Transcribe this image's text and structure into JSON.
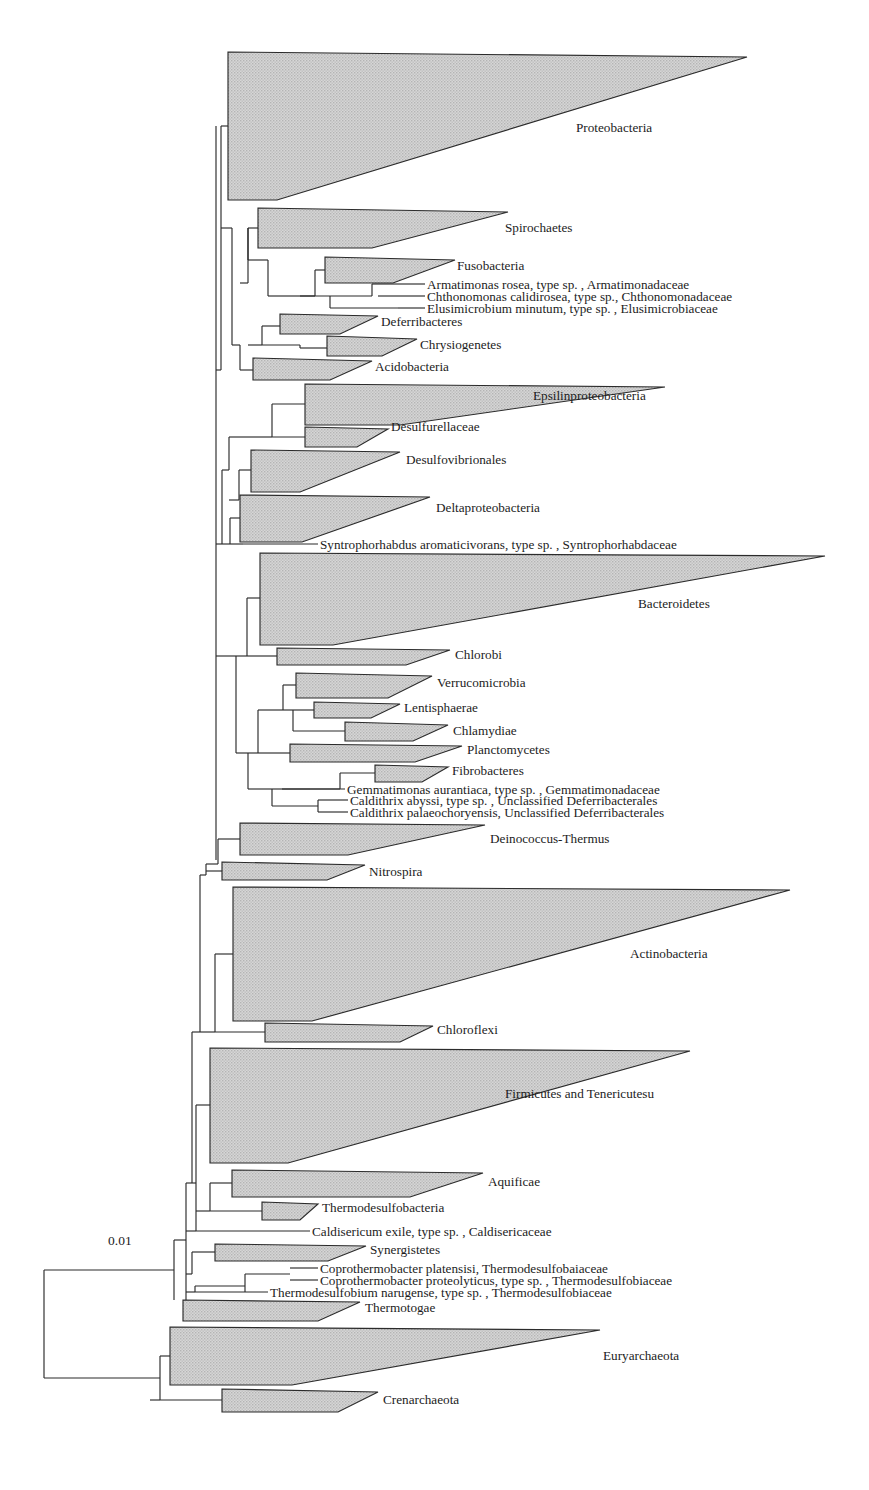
{
  "figure": {
    "type": "phylogenetic-tree",
    "orientation": "left-to-right",
    "background_color": "#ffffff",
    "clade_fill_color": "#c8c8c8",
    "line_color": "#2b2b2b",
    "text_color": "#1c1c1c"
  },
  "scale": {
    "label": "0.01",
    "x": 108,
    "y": 1245,
    "bar_visible": false
  },
  "chart_data": {
    "type": "tree",
    "title": "",
    "scale_bar": "0.01",
    "leaf_count": 38,
    "collapsed_clades": [
      "Proteobacteria",
      "Spirochaetes",
      "Fusobacteria",
      "Deferribacteres",
      "Chrysiogenetes",
      "Acidobacteria",
      "Epsilinproteobacteria",
      "Desulfurellaceae",
      "Desulfovibrionales",
      "Deltaproteobacteria",
      "Bacteroidetes",
      "Chlorobi",
      "Verrucomicrobia",
      "Lentisphaerae",
      "Chlamydiae",
      "Planctomycetes",
      "Fibrobacteres",
      "Deinococcus-Thermus",
      "Nitrospira",
      "Actinobacteria",
      "Chloroflexi",
      "Firmicutes and Tenericutesu",
      "Aquificae",
      "Thermodesulfobacteria",
      "Synergistetes",
      "Thermotogae",
      "Euryarchaeota",
      "Crenarchaeota"
    ],
    "terminal_taxa": [
      "Armatimonas rosea, type sp. , Armatimonadaceae",
      "Chthonomonas calidirosea, type sp., Chthonomonadaceae",
      "Elusimicrobium minutum, type sp. , Elusimicrobiaceae",
      "Syntrophorhabdus aromaticivorans, type sp. , Syntrophorhabdaceae",
      "Gemmatimonas aurantiaca, type sp. , Gemmatimonadaceae",
      "Caldithrix abyssi, type sp. , Unclassified Deferribacterales",
      "Caldithrix palaeochoryensis, Unclassified Deferribacterales",
      "Caldisericum exile, type sp. , Caldisericaceae",
      "Coprothermobacter platensisi, Thermodesulfobaiaceae",
      "Coprothermobacter proteolyticus, type sp. , Thermodesulfobiaceae",
      "Thermodesulfobium narugense, type sp. , Thermodesulfobiaceae"
    ]
  },
  "clades": [
    {
      "name": "proteobacteria",
      "label": "Proteobacteria",
      "style": "italic",
      "base_x": 228,
      "top_y": 52,
      "bottom_y": 200,
      "tip_x": 747,
      "tip_y": 57,
      "notch_x": 277,
      "label_x": 576,
      "label_y": 132
    },
    {
      "name": "spirochaetes",
      "label": "Spirochaetes",
      "style": "italic",
      "base_x": 258,
      "top_y": 208,
      "bottom_y": 248,
      "tip_x": 508,
      "tip_y": 212,
      "notch_x": 372,
      "label_x": 505,
      "label_y": 232
    },
    {
      "name": "fusobacteria",
      "label": "Fusobacteria",
      "style": "italic",
      "base_x": 325,
      "top_y": 257,
      "bottom_y": 283,
      "tip_x": 455,
      "tip_y": 260,
      "notch_x": 393,
      "label_x": 457,
      "label_y": 270
    },
    {
      "name": "deferribacteres",
      "label": "Deferribacteres",
      "style": "italic",
      "base_x": 280,
      "top_y": 314,
      "bottom_y": 334,
      "tip_x": 378,
      "tip_y": 316,
      "notch_x": 340,
      "label_x": 381,
      "label_y": 326
    },
    {
      "name": "chrysiogenetes",
      "label": "Chrysiogenetes",
      "style": "italic",
      "base_x": 327,
      "top_y": 336,
      "bottom_y": 356,
      "tip_x": 417,
      "tip_y": 339,
      "notch_x": 382,
      "label_x": 420,
      "label_y": 349
    },
    {
      "name": "acidobacteria",
      "label": "Acidobacteria",
      "style": "italic",
      "base_x": 253,
      "top_y": 358,
      "bottom_y": 380,
      "tip_x": 372,
      "tip_y": 361,
      "notch_x": 330,
      "label_x": 375,
      "label_y": 371
    },
    {
      "name": "epsilinproteobacteria",
      "label": "Epsilinproteobacteria",
      "style": "italic",
      "base_x": 305,
      "top_y": 384,
      "bottom_y": 425,
      "tip_x": 665,
      "tip_y": 387,
      "notch_x": 400,
      "label_x": 533,
      "label_y": 400
    },
    {
      "name": "desulfurellaceae",
      "label": "Desulfurellaceae",
      "style": "italic",
      "base_x": 305,
      "top_y": 427,
      "bottom_y": 447,
      "tip_x": 388,
      "tip_y": 429,
      "notch_x": 357,
      "label_x": 391,
      "label_y": 431
    },
    {
      "name": "desulfovibrionales",
      "label": "Desulfovibrionales",
      "style": "italic",
      "base_x": 251,
      "top_y": 450,
      "bottom_y": 492,
      "tip_x": 400,
      "tip_y": 452,
      "notch_x": 300,
      "label_x": 406,
      "label_y": 464
    },
    {
      "name": "deltaproteobacteria",
      "label": "Deltaproteobacteria",
      "style": "italic",
      "base_x": 240,
      "top_y": 495,
      "bottom_y": 542,
      "tip_x": 430,
      "tip_y": 497,
      "notch_x": 302,
      "label_x": 436,
      "label_y": 512
    },
    {
      "name": "bacteroidetes",
      "label": "Bacteroidetes",
      "style": "italic",
      "base_x": 260,
      "top_y": 553,
      "bottom_y": 645,
      "tip_x": 825,
      "tip_y": 556,
      "notch_x": 333,
      "label_x": 638,
      "label_y": 608
    },
    {
      "name": "chlorobi",
      "label": "Chlorobi",
      "style": "italic",
      "base_x": 277,
      "top_y": 648,
      "bottom_y": 665,
      "tip_x": 450,
      "tip_y": 650,
      "notch_x": 406,
      "label_x": 455,
      "label_y": 659
    },
    {
      "name": "verrucomicrobia",
      "label": "Verrucomicrobia",
      "style": "italic",
      "base_x": 296,
      "top_y": 673,
      "bottom_y": 698,
      "tip_x": 432,
      "tip_y": 676,
      "notch_x": 388,
      "label_x": 437,
      "label_y": 687
    },
    {
      "name": "lentisphaerae",
      "label": "Lentisphaerae",
      "style": "italic",
      "base_x": 314,
      "top_y": 702,
      "bottom_y": 718,
      "tip_x": 400,
      "tip_y": 704,
      "notch_x": 371,
      "label_x": 404,
      "label_y": 712
    },
    {
      "name": "chlamydiae",
      "label": "Chlamydiae",
      "style": "italic",
      "base_x": 345,
      "top_y": 722,
      "bottom_y": 741,
      "tip_x": 448,
      "tip_y": 725,
      "notch_x": 413,
      "label_x": 453,
      "label_y": 735
    },
    {
      "name": "planctomycetes",
      "label": "Planctomycetes",
      "style": "italic",
      "base_x": 290,
      "top_y": 744,
      "bottom_y": 762,
      "tip_x": 462,
      "tip_y": 746,
      "notch_x": 415,
      "label_x": 467,
      "label_y": 754
    },
    {
      "name": "fibrobacteres",
      "label": "Fibrobacteres",
      "style": "italic",
      "base_x": 375,
      "top_y": 765,
      "bottom_y": 782,
      "tip_x": 448,
      "tip_y": 767,
      "notch_x": 422,
      "label_x": 452,
      "label_y": 775
    },
    {
      "name": "deinococcus-thermus",
      "label": "Deinococcus-Thermus",
      "style": "italic",
      "base_x": 240,
      "top_y": 823,
      "bottom_y": 855,
      "tip_x": 485,
      "tip_y": 825,
      "notch_x": 348,
      "label_x": 490,
      "label_y": 843
    },
    {
      "name": "nitrospira",
      "label": "Nitrospira",
      "style": "italic",
      "base_x": 222,
      "top_y": 862,
      "bottom_y": 880,
      "tip_x": 365,
      "tip_y": 865,
      "notch_x": 327,
      "label_x": 369,
      "label_y": 876
    },
    {
      "name": "actinobacteria",
      "label": "Actinobacteria",
      "style": "italic",
      "base_x": 233,
      "top_y": 887,
      "bottom_y": 1021,
      "tip_x": 790,
      "tip_y": 890,
      "notch_x": 312,
      "label_x": 630,
      "label_y": 958
    },
    {
      "name": "chloroflexi",
      "label": "Chloroflexi",
      "style": "italic",
      "base_x": 265,
      "top_y": 1023,
      "bottom_y": 1042,
      "tip_x": 433,
      "tip_y": 1026,
      "notch_x": 400,
      "label_x": 437,
      "label_y": 1034
    },
    {
      "name": "firmicutes-tenericutesu",
      "label": "Firmicutes and Tenericutesu",
      "style": "mixed",
      "label_parts": [
        {
          "text": "Firmicutes",
          "style": "italic"
        },
        {
          "text": " and ",
          "style": "roman"
        },
        {
          "text": "Tenericutesu",
          "style": "italic"
        }
      ],
      "base_x": 210,
      "top_y": 1048,
      "bottom_y": 1163,
      "tip_x": 690,
      "tip_y": 1051,
      "notch_x": 288,
      "label_x": 505,
      "label_y": 1098
    },
    {
      "name": "aquificae",
      "label": "Aquificae",
      "style": "italic",
      "base_x": 232,
      "top_y": 1170,
      "bottom_y": 1197,
      "tip_x": 483,
      "tip_y": 1173,
      "notch_x": 410,
      "label_x": 488,
      "label_y": 1186
    },
    {
      "name": "thermodesulfobacteria",
      "label": "Thermodesulfobacteria",
      "style": "italic",
      "base_x": 262,
      "top_y": 1202,
      "bottom_y": 1220,
      "tip_x": 318,
      "tip_y": 1204,
      "notch_x": 300,
      "label_x": 322,
      "label_y": 1212
    },
    {
      "name": "synergistetes",
      "label": "Synergistetes",
      "style": "italic",
      "base_x": 215,
      "top_y": 1244,
      "bottom_y": 1261,
      "tip_x": 366,
      "tip_y": 1246,
      "notch_x": 328,
      "label_x": 370,
      "label_y": 1254
    },
    {
      "name": "thermotogae",
      "label": "Thermotogae",
      "style": "italic",
      "base_x": 183,
      "top_y": 1300,
      "bottom_y": 1321,
      "tip_x": 360,
      "tip_y": 1302,
      "notch_x": 318,
      "label_x": 365,
      "label_y": 1312
    },
    {
      "name": "euryarchaeota",
      "label": "Euryarchaeota",
      "style": "italic",
      "base_x": 170,
      "top_y": 1327,
      "bottom_y": 1385,
      "tip_x": 600,
      "tip_y": 1330,
      "notch_x": 292,
      "label_x": 603,
      "label_y": 1360
    },
    {
      "name": "crenarchaeota",
      "label": "Crenarchaeota",
      "style": "italic",
      "base_x": 222,
      "top_y": 1389,
      "bottom_y": 1412,
      "tip_x": 378,
      "tip_y": 1392,
      "notch_x": 338,
      "label_x": 383,
      "label_y": 1404
    }
  ],
  "terminals": [
    {
      "name": "armatimonas-rosea",
      "y": 284,
      "line_x1": 398,
      "line_x2": 425,
      "label_x": 427,
      "parts": [
        {
          "text": "Armatimonas rosea",
          "style": "italic"
        },
        {
          "text": ", type sp. , ",
          "style": "roman"
        },
        {
          "text": "Armatimonadaceae",
          "style": "italic"
        }
      ]
    },
    {
      "name": "chthonomonas-calidirosea",
      "y": 296,
      "line_x1": 398,
      "line_x2": 425,
      "label_x": 427,
      "parts": [
        {
          "text": "Chthonomonas calidirosea",
          "style": "italic"
        },
        {
          "text": ", type sp., ",
          "style": "roman"
        },
        {
          "text": "Chthonomonadaceae",
          "style": "italic"
        }
      ]
    },
    {
      "name": "elusimicrobium-minutum",
      "y": 308,
      "line_x1": 398,
      "line_x2": 425,
      "label_x": 427,
      "parts": [
        {
          "text": "Elusimicrobium minutum",
          "style": "italic"
        },
        {
          "text": ", type sp. , ",
          "style": "roman"
        },
        {
          "text": "Elusimicrobiaceae",
          "style": "italic"
        }
      ]
    },
    {
      "name": "syntrophorhabdus-aromaticivorans",
      "y": 544,
      "line_x1": 243,
      "line_x2": 318,
      "label_x": 320,
      "parts": [
        {
          "text": "Syntrophorhabdus aromaticivorans",
          "style": "italic"
        },
        {
          "text": ", type sp. , ",
          "style": "roman"
        },
        {
          "text": "Syntrophorhabdaceae",
          "style": "italic"
        }
      ]
    },
    {
      "name": "gemmatimonas-aurantiaca",
      "y": 789,
      "line_x1": 310,
      "line_x2": 345,
      "label_x": 347,
      "parts": [
        {
          "text": "Gemmatimonas aurantiaca",
          "style": "italic"
        },
        {
          "text": ", type sp. , ",
          "style": "roman"
        },
        {
          "text": "Gemmatimonadaceae",
          "style": "italic"
        }
      ]
    },
    {
      "name": "caldithrix-abyssi",
      "y": 800,
      "line_x1": 330,
      "line_x2": 348,
      "label_x": 350,
      "parts": [
        {
          "text": "Caldithrix abyssi",
          "style": "italic"
        },
        {
          "text": ", type sp. , Unclassified ",
          "style": "roman"
        },
        {
          "text": "Deferribacterales",
          "style": "italic"
        }
      ]
    },
    {
      "name": "caldithrix-palaeochoryensis",
      "y": 812,
      "line_x1": 330,
      "line_x2": 348,
      "label_x": 350,
      "parts": [
        {
          "text": "Caldithrix palaeochoryensis",
          "style": "italic"
        },
        {
          "text": ", Unclassified ",
          "style": "roman"
        },
        {
          "text": "Deferribacterales",
          "style": "italic"
        }
      ]
    },
    {
      "name": "caldisericum-exile",
      "y": 1231,
      "line_x1": 196,
      "line_x2": 310,
      "label_x": 312,
      "parts": [
        {
          "text": "Caldisericum exile",
          "style": "italic"
        },
        {
          "text": ", type sp. , ",
          "style": "roman"
        },
        {
          "text": "Caldisericaceae",
          "style": "italic"
        }
      ]
    },
    {
      "name": "coprothermobacter-platensisi",
      "y": 1268,
      "line_x1": 290,
      "line_x2": 318,
      "label_x": 320,
      "parts": [
        {
          "text": "Coprothermobacter platensisi, Thermodesulfobaiaceae",
          "style": "italic"
        }
      ]
    },
    {
      "name": "coprothermobacter-proteolyticus",
      "y": 1280,
      "line_x1": 290,
      "line_x2": 318,
      "label_x": 320,
      "parts": [
        {
          "text": "Coprothermobacter proteolyticus",
          "style": "italic"
        },
        {
          "text": ", type sp. , ",
          "style": "roman"
        },
        {
          "text": "Thermodesulfobiaceae",
          "style": "italic"
        }
      ]
    },
    {
      "name": "thermodesulfobium-narugense",
      "y": 1292,
      "line_x1": 195,
      "line_x2": 268,
      "label_x": 270,
      "parts": [
        {
          "text": "Thermodesulfobium narugense",
          "style": "italic"
        },
        {
          "text": ", type sp. , ",
          "style": "roman"
        },
        {
          "text": "Thermodesulfobiaceae",
          "style": "italic"
        }
      ]
    }
  ],
  "branches": [
    "M228,126 L221,126",
    "M221,126 L221,370",
    "M221,370 L216,370",
    "M258,228 L248,228",
    "M248,228 L248,283",
    "M248,283 L240,283",
    "M325,270 L315,270",
    "M315,270 L315,296",
    "M315,296 L300,296",
    "M398,284 L372,284",
    "M372,284 L372,296",
    "M372,296 L300,296",
    "M398,296 L378,296",
    "M398,308 L330,308",
    "M330,308 L330,296",
    "M300,296 L268,296",
    "M268,296 L268,260",
    "M268,260 L248,260",
    "M248,260 L248,228",
    "M280,326 L262,326",
    "M262,326 L262,345",
    "M262,345 L248,345",
    "M327,348 L300,348",
    "M300,348 L300,345",
    "M300,345 L262,345",
    "M253,370 L240,370",
    "M240,370 L240,345",
    "M240,345 L232,345",
    "M232,345 L232,283",
    "M232,283 L232,228",
    "M232,228 L221,228",
    "M305,404 L272,404",
    "M272,404 L272,437",
    "M272,437 L246,437",
    "M305,437 L272,437",
    "M251,470 L239,470",
    "M239,470 L239,500",
    "M239,500 L229,500",
    "M246,437 L229,437",
    "M229,437 L229,470",
    "M240,518 L230,518",
    "M230,518 L230,544",
    "M230,544 L222,544",
    "M243,544 L230,544",
    "M229,470 L222,470",
    "M222,470 L222,544",
    "M222,544 L216,544",
    "M260,598 L247,598",
    "M247,598 L247,656",
    "M247,656 L236,656",
    "M277,656 L247,656",
    "M296,685 L283,685",
    "M283,685 L283,710",
    "M283,710 L270,710",
    "M314,710 L283,710",
    "M345,731 L293,731",
    "M293,731 L293,710",
    "M270,710 L258,710",
    "M258,710 L258,753",
    "M290,753 L258,753",
    "M375,773 L340,773",
    "M340,773 L340,789",
    "M340,789 L282,789",
    "M310,789 L282,789",
    "M282,789 L260,789",
    "M330,800 L318,800",
    "M318,800 L318,812",
    "M318,812 L330,812",
    "M318,806 L272,806",
    "M272,806 L272,789",
    "M260,789 L248,789",
    "M248,789 L248,753",
    "M258,753 L248,753",
    "M248,753 L236,753",
    "M236,753 L236,656",
    "M236,656 L216,656",
    "M216,126 L216,860",
    "M240,839 L218,839",
    "M218,839 L218,864",
    "M218,864 L206,864",
    "M222,871 L206,871",
    "M206,864 L206,875",
    "M206,875 L200,875",
    "M233,954 L215,954",
    "M215,954 L215,1032",
    "M215,1032 L200,1032",
    "M265,1032 L215,1032",
    "M200,875 L200,1032",
    "M200,1032 L192,1032",
    "M210,1105 L196,1105",
    "M196,1105 L196,1183",
    "M196,1183 L186,1183",
    "M232,1183 L210,1183",
    "M210,1183 L210,1211",
    "M210,1211 L196,1211",
    "M262,1211 L210,1211",
    "M196,1183 L196,1231",
    "M196,1231 L186,1231",
    "M215,1252 L192,1252",
    "M192,1252 L192,1274",
    "M192,1274 L186,1274",
    "M290,1274 L245,1274",
    "M245,1274 L245,1286",
    "M245,1286 L245,1292",
    "M195,1292 L186,1292",
    "M245,1286 L195,1286",
    "M195,1286 L195,1292",
    "M183,1310 L186,1310",
    "M186,1183 L186,1310",
    "M192,1032 L192,1183",
    "M186,1240 L174,1240",
    "M174,1240 L174,1300",
    "M170,1356 L160,1356",
    "M160,1356 L160,1400",
    "M160,1400 L150,1400",
    "M222,1400 L160,1400",
    "M160,1378 L44,1378",
    "M44,1378 L44,1270",
    "M44,1270 L174,1270"
  ]
}
